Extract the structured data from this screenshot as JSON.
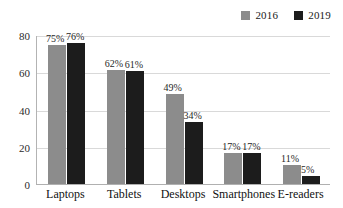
{
  "chart_data": {
    "type": "bar",
    "title": "",
    "subtitle": "",
    "xlabel": "",
    "ylabel": "",
    "categories": [
      "Laptops",
      "Tablets",
      "Desktops",
      "Smartphones",
      "E-readers"
    ],
    "series": [
      {
        "name": "2016",
        "color": "#8c8c8c",
        "values": [
          75,
          62,
          49,
          17,
          11
        ],
        "labels": [
          "75%",
          "62%",
          "49%",
          "17%",
          "11%"
        ]
      },
      {
        "name": "2019",
        "color": "#1c1c1c",
        "values": [
          76,
          61,
          34,
          17,
          5
        ],
        "labels": [
          "76%",
          "61%",
          "34%",
          "17%",
          "5%"
        ]
      }
    ],
    "ylim": [
      0,
      80
    ],
    "yticks": [
      0,
      20,
      40,
      60,
      80
    ],
    "ytick_labels": [
      "0",
      "20",
      "40",
      "60",
      "80"
    ],
    "grid": true,
    "grid_axis": "y",
    "legend_position": "top-right",
    "background_color": "#ffffff",
    "gridline_color": "#d9d9d9",
    "axis_color": "#b0b0b0"
  },
  "legend": {
    "entries": [
      {
        "label": "2016",
        "color": "#8c8c8c"
      },
      {
        "label": "2019",
        "color": "#1c1c1c"
      }
    ]
  }
}
